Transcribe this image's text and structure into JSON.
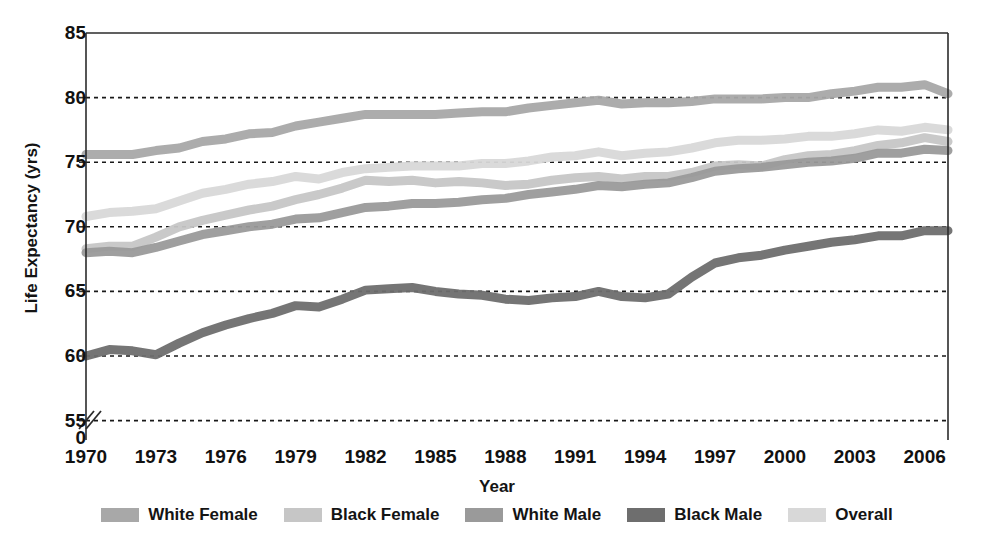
{
  "chart_data": {
    "type": "line",
    "title": "",
    "xlabel": "Year",
    "ylabel": "Life Expectancy (yrs)",
    "xlim": [
      1970,
      2007
    ],
    "ylim": [
      53.5,
      85
    ],
    "yticks": [
      85,
      80,
      75,
      70,
      65,
      60,
      55
    ],
    "y_axis_break": true,
    "y_axis_break_label": "0",
    "xticks": [
      1970,
      1973,
      1976,
      1979,
      1982,
      1985,
      1988,
      1991,
      1994,
      1997,
      2000,
      2003,
      2006
    ],
    "grid": "horizontal-dashed",
    "legend_position": "bottom",
    "x": [
      1970,
      1971,
      1972,
      1973,
      1974,
      1975,
      1976,
      1977,
      1978,
      1979,
      1980,
      1981,
      1982,
      1983,
      1984,
      1985,
      1986,
      1987,
      1988,
      1989,
      1990,
      1991,
      1992,
      1993,
      1994,
      1995,
      1996,
      1997,
      1998,
      1999,
      2000,
      2001,
      2002,
      2003,
      2004,
      2005,
      2006,
      2007
    ],
    "series": [
      {
        "name": "White Female",
        "color": "#a8a8a8",
        "values": [
          75.6,
          75.6,
          75.6,
          75.9,
          76.1,
          76.6,
          76.8,
          77.2,
          77.3,
          77.8,
          78.1,
          78.4,
          78.7,
          78.7,
          78.7,
          78.7,
          78.8,
          78.9,
          78.9,
          79.2,
          79.4,
          79.6,
          79.8,
          79.5,
          79.6,
          79.6,
          79.7,
          79.9,
          79.9,
          79.9,
          80.0,
          80.0,
          80.3,
          80.5,
          80.8,
          80.8,
          81.0,
          80.3
        ]
      },
      {
        "name": "Black Female",
        "color": "#c6c6c6",
        "values": [
          68.3,
          68.5,
          68.5,
          69.2,
          70.0,
          70.5,
          70.9,
          71.3,
          71.6,
          72.1,
          72.5,
          73.0,
          73.6,
          73.5,
          73.6,
          73.4,
          73.5,
          73.4,
          73.2,
          73.3,
          73.6,
          73.8,
          73.9,
          73.7,
          73.9,
          73.9,
          74.2,
          74.7,
          74.8,
          74.7,
          75.2,
          75.5,
          75.6,
          75.9,
          76.3,
          76.5,
          76.9,
          76.6
        ]
      },
      {
        "name": "White Male",
        "color": "#9a9a9a",
        "values": [
          68.0,
          68.1,
          68.0,
          68.4,
          68.9,
          69.4,
          69.7,
          70.0,
          70.2,
          70.6,
          70.7,
          71.1,
          71.5,
          71.6,
          71.8,
          71.8,
          71.9,
          72.1,
          72.2,
          72.5,
          72.7,
          72.9,
          73.2,
          73.1,
          73.3,
          73.4,
          73.8,
          74.3,
          74.5,
          74.6,
          74.8,
          75.0,
          75.1,
          75.3,
          75.7,
          75.7,
          76.0,
          75.9
        ]
      },
      {
        "name": "Black Male",
        "color": "#6e6e6e",
        "values": [
          60.0,
          60.5,
          60.4,
          60.1,
          61.0,
          61.8,
          62.4,
          62.9,
          63.3,
          63.9,
          63.8,
          64.4,
          65.1,
          65.2,
          65.3,
          65.0,
          64.8,
          64.7,
          64.4,
          64.3,
          64.5,
          64.6,
          65.0,
          64.6,
          64.5,
          64.8,
          66.1,
          67.2,
          67.6,
          67.8,
          68.2,
          68.5,
          68.8,
          69.0,
          69.3,
          69.3,
          69.7,
          69.7
        ]
      },
      {
        "name": "Overall",
        "color": "#d8d8d8",
        "values": [
          70.8,
          71.1,
          71.2,
          71.4,
          72.0,
          72.6,
          72.9,
          73.3,
          73.5,
          73.9,
          73.7,
          74.2,
          74.5,
          74.6,
          74.7,
          74.7,
          74.7,
          74.9,
          74.9,
          75.1,
          75.4,
          75.5,
          75.8,
          75.5,
          75.7,
          75.8,
          76.1,
          76.5,
          76.7,
          76.7,
          76.8,
          77.0,
          77.0,
          77.2,
          77.5,
          77.4,
          77.7,
          77.5
        ]
      }
    ]
  },
  "axis": {
    "ylabel": "Life Expectancy (yrs)",
    "xlabel": "Year",
    "yticks": [
      "85",
      "80",
      "75",
      "70",
      "65",
      "60",
      "55"
    ],
    "zero_label": "0",
    "xticks": [
      "1970",
      "1973",
      "1976",
      "1979",
      "1982",
      "1985",
      "1988",
      "1991",
      "1994",
      "1997",
      "2000",
      "2003",
      "2006"
    ]
  },
  "legend": {
    "items": [
      {
        "label": "White Female",
        "color": "#a8a8a8"
      },
      {
        "label": "Black Female",
        "color": "#c6c6c6"
      },
      {
        "label": "White Male",
        "color": "#9a9a9a"
      },
      {
        "label": "Black Male",
        "color": "#6e6e6e"
      },
      {
        "label": "Overall",
        "color": "#d8d8d8"
      }
    ]
  }
}
